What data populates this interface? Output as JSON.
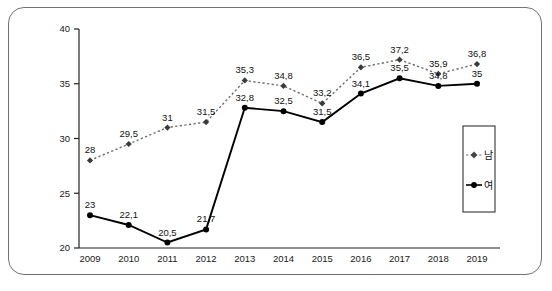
{
  "chart_data": {
    "type": "line",
    "title": "",
    "xlabel": "",
    "ylabel": "",
    "categories": [
      "2009",
      "2010",
      "2011",
      "2012",
      "2013",
      "2014",
      "2015",
      "2016",
      "2017",
      "2018",
      "2019"
    ],
    "ylim": [
      20,
      40
    ],
    "yticks": [
      "20",
      "25",
      "30",
      "35",
      "40"
    ],
    "ytick_values": [
      20,
      25,
      30,
      35,
      40
    ],
    "grid": false,
    "legend_position": "right",
    "series": [
      {
        "name": "남",
        "style": "dotted",
        "marker": "diamond",
        "color": "#6b6b6b",
        "values": [
          28,
          29.5,
          31,
          31.5,
          35.3,
          34.8,
          33.2,
          36.5,
          37.2,
          35.9,
          36.8
        ],
        "labels": [
          "28",
          "29,5",
          "31",
          "31,5",
          "35,3",
          "34,8",
          "33,2",
          "36,5",
          "37,2",
          "35,9",
          "36,8"
        ]
      },
      {
        "name": "여",
        "style": "solid",
        "marker": "circle",
        "color": "#000000",
        "values": [
          23,
          22.1,
          20.5,
          21.7,
          32.8,
          32.5,
          31.5,
          34.1,
          35.5,
          34.8,
          35
        ],
        "labels": [
          "23",
          "22,1",
          "20,5",
          "21,7",
          "32,8",
          "32,5",
          "31,5",
          "34,1",
          "35,5",
          "34,8",
          "35"
        ]
      }
    ]
  },
  "legend": {
    "items": [
      {
        "label": "남"
      },
      {
        "label": "여"
      }
    ]
  }
}
